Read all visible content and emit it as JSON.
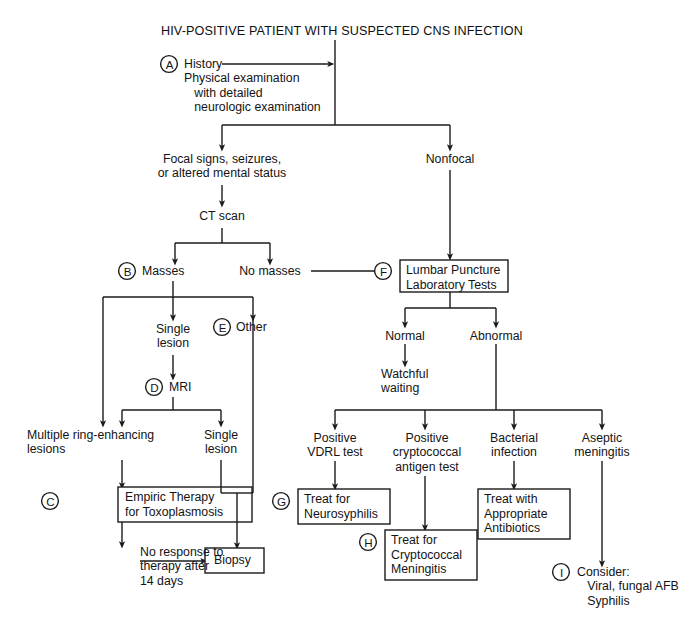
{
  "figure": {
    "title": "HIV-POSITIVE PATIENT WITH SUSPECTED CNS INFECTION",
    "type": "clinical-decision-flowchart",
    "line_color": "#1b1b1b",
    "text_color": "#141414",
    "background": "#ffffff"
  },
  "markers": {
    "a": "A",
    "b": "B",
    "c": "C",
    "d": "D",
    "e": "E",
    "f": "F",
    "g": "G",
    "h": "H",
    "i": "I"
  },
  "nodes": {
    "history": "History\nPhysical examination\n   with detailed\n   neurologic examination",
    "focal": "Focal signs, seizures,\nor altered mental status",
    "nonfocal": "Nonfocal",
    "ct_scan": "CT scan",
    "masses": "Masses",
    "no_masses": "No masses",
    "single_lesion_1": "Single\nlesion",
    "other": "Other",
    "mri": "MRI",
    "multiple_ring": "Multiple ring-enhancing\nlesions",
    "single_lesion_2": "Single\nlesion",
    "no_response": "No response to\ntherapy after\n14 days",
    "normal": "Normal",
    "abnormal": "Abnormal",
    "watchful": "Watchful\nwaiting",
    "positive_vdrl": "Positive\nVDRL test",
    "positive_crypto": "Positive\ncryptococcal\nantigen test",
    "bacterial": "Bacterial\ninfection",
    "aseptic": "Aseptic\nmeningitis",
    "consider": "Consider:\n   Viral, fungal AFB\n   Syphilis"
  },
  "boxes": {
    "lumbar_puncture": "Lumbar Puncture\nLaboratory Tests",
    "empiric_therapy": "Empiric Therapy\nfor Toxoplasmosis",
    "biopsy": "Biopsy",
    "treat_neurosyphilis": "Treat for\nNeurosyphilis",
    "treat_cryptococcal": "Treat for\nCryptococcal\nMeningitis",
    "treat_antibiotics": "Treat with\nAppropriate\nAntibiotics"
  }
}
